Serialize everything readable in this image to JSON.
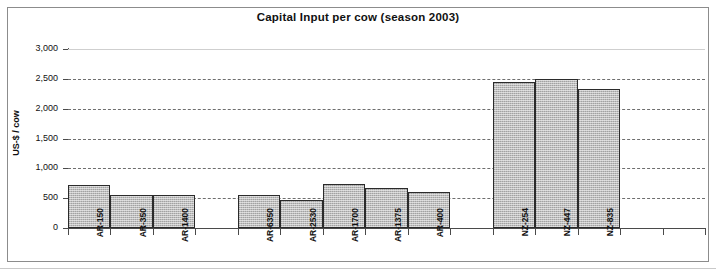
{
  "chart_data": {
    "type": "bar",
    "title": "Capital Input per cow (season 2003)",
    "xlabel": "",
    "ylabel": "US-$ / cow",
    "ylim": [
      0,
      3000
    ],
    "ytick_step": 500,
    "ytick_labels": [
      "3,000",
      "2,500",
      "2,000",
      "1,500",
      "1,000",
      "500",
      "0"
    ],
    "ytick_values": [
      3000,
      2500,
      2000,
      1500,
      1000,
      500,
      0
    ],
    "grid": "horizontal-dashed",
    "legend": "none",
    "bar_fill_color": "#b4b4b4",
    "bar_border_color": "#2b2b2b",
    "categories": [
      "AR-150",
      "AR-350",
      "AR-1400",
      "",
      "AR-6350",
      "AR-2530",
      "AR-1700",
      "AR-1375",
      "AR-400",
      "",
      "NZ-254",
      "NZ-447",
      "NZ-835",
      "",
      ""
    ],
    "values": [
      720,
      560,
      555,
      null,
      550,
      470,
      740,
      665,
      610,
      null,
      2450,
      2490,
      2325,
      null,
      null
    ],
    "groups": [
      {
        "name": "AR group 1",
        "categories": [
          "AR-150",
          "AR-350",
          "AR-1400"
        ],
        "values": [
          720,
          560,
          555
        ]
      },
      {
        "name": "AR group 2",
        "categories": [
          "AR-6350",
          "AR-2530",
          "AR-1700",
          "AR-1375",
          "AR-400"
        ],
        "values": [
          550,
          470,
          740,
          665,
          610
        ]
      },
      {
        "name": "NZ group",
        "categories": [
          "NZ-254",
          "NZ-447",
          "NZ-835"
        ],
        "values": [
          2450,
          2490,
          2325
        ]
      }
    ]
  }
}
